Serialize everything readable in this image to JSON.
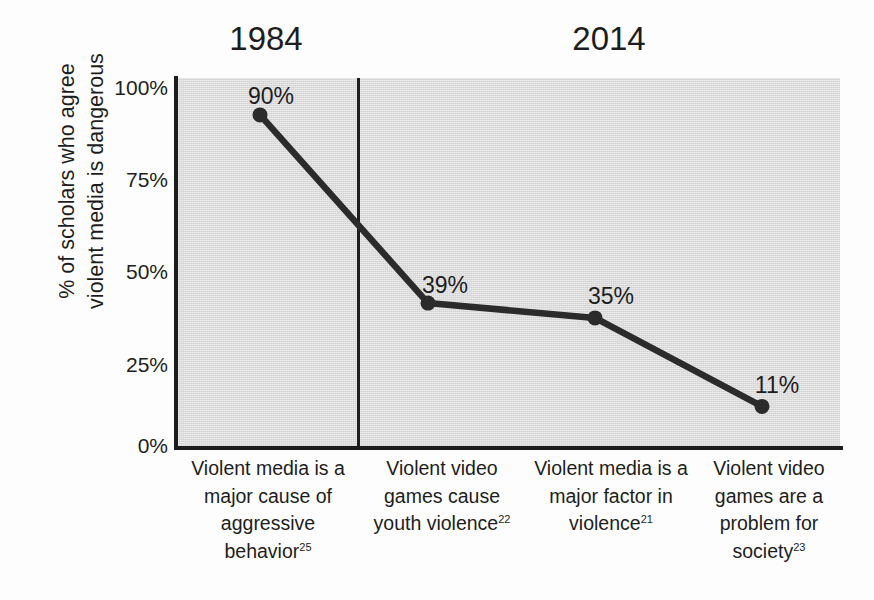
{
  "chart_data": {
    "type": "line",
    "title": "",
    "xlabel": "",
    "ylabel_lines": [
      "% of scholars who agree",
      "violent media is dangerous"
    ],
    "ylim": [
      0,
      100
    ],
    "yticks": [
      "100%",
      "75%",
      "50%",
      "25%",
      "0%"
    ],
    "ytick_values": [
      100,
      75,
      50,
      25,
      0
    ],
    "grid": false,
    "legend": "none",
    "categories": [
      "Violent media is a major cause of aggressive behavior",
      "Violent video games cause youth violence",
      "Violent media is a major factor in violence",
      "Violent video games are a problem for society"
    ],
    "category_citations": [
      "25",
      "22",
      "21",
      "23"
    ],
    "values": [
      90,
      39,
      35,
      11
    ],
    "value_labels": [
      "90%",
      "39%",
      "35%",
      "11%"
    ],
    "period_groups": [
      {
        "label": "1984",
        "categories": [
          0
        ]
      },
      {
        "label": "2014",
        "categories": [
          1,
          2,
          3
        ]
      }
    ],
    "annotations": {
      "period_divider": "vertical line separating 1984 from 2014"
    },
    "colors": {
      "line": "#2b2b2b",
      "marker": "#2b2b2b",
      "plot_background": "#d9d9d9",
      "axis": "#1d1d1d",
      "text": "#1d1d1d",
      "figure_background": "#fdfdfd"
    }
  },
  "axis": {
    "ylabel": {
      "line1": "% of scholars who agree",
      "line2": "violent media is dangerous"
    },
    "yticks": [
      {
        "label": "100%"
      },
      {
        "label": "75%"
      },
      {
        "label": "50%"
      },
      {
        "label": "25%"
      },
      {
        "label": "0%"
      }
    ]
  },
  "periods": [
    {
      "label": "1984"
    },
    {
      "label": "2014"
    }
  ],
  "points": [
    {
      "label": "90%"
    },
    {
      "label": "39%"
    },
    {
      "label": "35%"
    },
    {
      "label": "11%"
    }
  ],
  "categories": [
    {
      "lines": [
        "Violent media is a",
        "major cause of",
        "aggressive",
        "behavior"
      ],
      "citation": "25"
    },
    {
      "lines": [
        "Violent video",
        "games cause",
        "youth violence"
      ],
      "citation": "22"
    },
    {
      "lines": [
        "Violent media is a",
        "major factor in",
        "violence"
      ],
      "citation": "21"
    },
    {
      "lines": [
        "Violent video",
        "games are a",
        "problem for",
        "society"
      ],
      "citation": "23"
    }
  ]
}
